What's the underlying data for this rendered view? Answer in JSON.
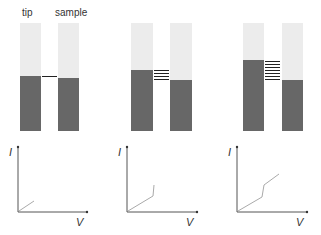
{
  "labels": {
    "tip": "tip",
    "sample": "sample"
  },
  "axes": {
    "y_label": "I",
    "x_label": "V"
  },
  "colors": {
    "band_empty": "#ececec",
    "band_filled": "#676767",
    "level_line": "#333333",
    "iv_curve": "#aaaaaa",
    "axis": "#555555"
  },
  "panels": [
    {
      "id": "zero-bias",
      "tunneling_levels": 1,
      "iv_curve": "linear-small"
    },
    {
      "id": "low-bias",
      "tunneling_levels": 4,
      "iv_curve": "linear-with-step"
    },
    {
      "id": "high-bias",
      "tunneling_levels": 7,
      "iv_curve": "linear-step-linear"
    }
  ]
}
